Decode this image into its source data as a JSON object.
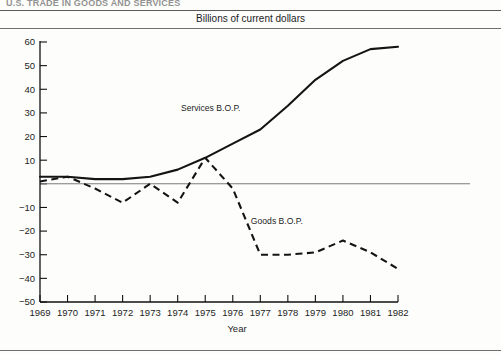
{
  "page": {
    "cut_off_heading": "U.S. TRADE IN GOODS AND SERVICES",
    "subtitle": "Billions of current dollars"
  },
  "chart_data": {
    "type": "line",
    "title": "Billions of current dollars",
    "xlabel": "Year",
    "ylabel": "",
    "x": [
      1969,
      1970,
      1971,
      1972,
      1973,
      1974,
      1975,
      1976,
      1977,
      1978,
      1979,
      1980,
      1981,
      1982
    ],
    "categories": [
      "1969",
      "1970",
      "1971",
      "1972",
      "1973",
      "1974",
      "1975",
      "1976",
      "1977",
      "1978",
      "1979",
      "1980",
      "1981",
      "1982"
    ],
    "xlim": [
      1969,
      1982
    ],
    "ylim": [
      -50,
      60
    ],
    "ytick_values": [
      60,
      50,
      40,
      30,
      20,
      10,
      0,
      -10,
      -20,
      -30,
      -40,
      -50
    ],
    "ytick_labels": [
      "60",
      "50",
      "40",
      "30",
      "20",
      "10",
      "",
      "−10",
      "−20",
      "−30",
      "−40",
      "−50"
    ],
    "grid": false,
    "zero_line": true,
    "legend": "inline-annotations",
    "series": [
      {
        "name": "Services B.O.P.",
        "style": "solid",
        "color": "#141414",
        "values": [
          3,
          3,
          2,
          2,
          3,
          6,
          11,
          17,
          23,
          33,
          44,
          52,
          57,
          58
        ]
      },
      {
        "name": "Goods B.O.P.",
        "style": "dashed",
        "color": "#141414",
        "values": [
          1,
          3,
          -2,
          -8,
          0,
          -8,
          11,
          -2,
          -30,
          -30,
          -29,
          -24,
          -29,
          -36
        ]
      }
    ],
    "annotations": [
      {
        "text": "Services B.O.P.",
        "x": 1975.2,
        "y": 31
      },
      {
        "text": "Goods B.O.P.",
        "x": 1977.6,
        "y": -17
      }
    ]
  }
}
